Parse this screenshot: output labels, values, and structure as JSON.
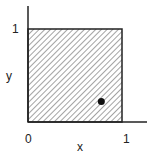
{
  "diagram": {
    "x_label": "x",
    "y_label": "y",
    "x_ticks": [
      "0",
      "1"
    ],
    "y_ticks": [
      "1"
    ],
    "region": {
      "x_range": [
        0,
        1
      ],
      "y_range": [
        0,
        1
      ],
      "fill": "hatched"
    },
    "point": {
      "x": 0.78,
      "y": 0.22
    },
    "colors": {
      "ink": "#222222",
      "background": "#ffffff"
    }
  }
}
